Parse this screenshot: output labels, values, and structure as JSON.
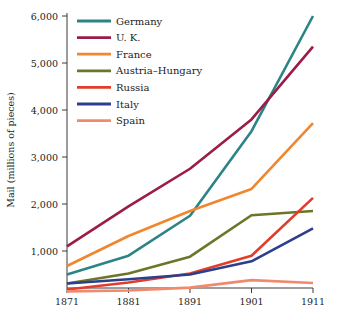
{
  "chart_data": {
    "type": "line",
    "title": "",
    "xlabel": "",
    "ylabel": "Mail (millions of pieces)",
    "x": [
      1871,
      1881,
      1891,
      1901,
      1911
    ],
    "xtick_labels": [
      "1871",
      "1881",
      "1891",
      "1901",
      "1911"
    ],
    "ytick_labels": [
      "1,000",
      "2,000",
      "3,000",
      "4,000",
      "5,000",
      "6,000"
    ],
    "ytick_values": [
      1000,
      2000,
      3000,
      4000,
      5000,
      6000
    ],
    "xlim": [
      1871,
      1911
    ],
    "ylim": [
      0,
      6000
    ],
    "grid": false,
    "legend_position": "top-left",
    "series": [
      {
        "name": "Germany",
        "color": "#2c8486",
        "values": [
          500,
          900,
          1750,
          3550,
          6000
        ]
      },
      {
        "name": "U. K.",
        "color": "#9c1c48",
        "values": [
          1100,
          1950,
          2750,
          3800,
          5350
        ]
      },
      {
        "name": "France",
        "color": "#f0872f",
        "values": [
          680,
          1320,
          1850,
          2320,
          3720
        ]
      },
      {
        "name": "Austria–Hungary",
        "color": "#6d7528",
        "values": [
          310,
          520,
          880,
          1760,
          1850
        ]
      },
      {
        "name": "Russia",
        "color": "#e03d2a",
        "values": [
          180,
          330,
          520,
          900,
          2130
        ]
      },
      {
        "name": "Italy",
        "color": "#2b3f8d",
        "values": [
          310,
          400,
          500,
          780,
          1480
        ]
      },
      {
        "name": "Spain",
        "color": "#f18a6d",
        "values": [
          140,
          160,
          220,
          380,
          320
        ]
      }
    ]
  },
  "axes": {
    "y_axis_title": "Mail (millions of pieces)"
  }
}
